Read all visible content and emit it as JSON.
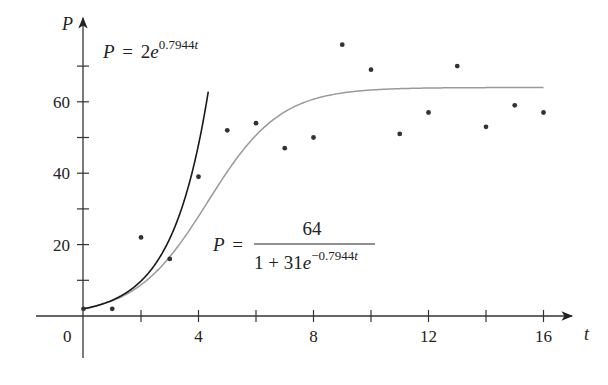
{
  "chart_data": {
    "type": "scatter",
    "title": "",
    "xlabel": "t",
    "ylabel": "P",
    "xlim": [
      -1.6,
      17.5
    ],
    "ylim": [
      -18,
      82
    ],
    "x_ticks": [
      0,
      2,
      4,
      6,
      8,
      10,
      12,
      14,
      16
    ],
    "x_tick_labels": [
      "0",
      "4",
      "8",
      "12",
      "16"
    ],
    "x_labeled_ticks": [
      0,
      4,
      8,
      12,
      16
    ],
    "y_ticks": [
      10,
      20,
      30,
      40,
      50,
      60,
      70
    ],
    "y_tick_labels": [
      "20",
      "40",
      "60"
    ],
    "y_labeled_ticks": [
      20,
      40,
      60
    ],
    "origin_label": "0",
    "grid": false,
    "legend": null,
    "series": [
      {
        "name": "data",
        "kind": "scatter",
        "color": "#333333",
        "x": [
          0,
          1,
          2,
          3,
          4,
          5,
          6,
          7,
          8,
          9,
          10,
          11,
          12,
          13,
          14,
          15,
          16
        ],
        "y": [
          2,
          2,
          22,
          16,
          39,
          52,
          54,
          47,
          50,
          76,
          69,
          51,
          57,
          70,
          53,
          59,
          57
        ]
      },
      {
        "name": "exponential",
        "kind": "line",
        "color": "#1a1a1a",
        "formula": "P = 2e^{0.7944t}",
        "a": 2,
        "k": 0.7944,
        "t_range": [
          0,
          4.35
        ]
      },
      {
        "name": "logistic",
        "kind": "line",
        "color": "#9a9a9a",
        "formula": "P = 64 / (1 + 31e^{-0.7944t})",
        "M": 64,
        "A": 31,
        "k": 0.7944,
        "t_range": [
          0,
          16
        ]
      }
    ],
    "annotations": [
      {
        "id": "exp-label",
        "lhs": "P",
        "eq": "=",
        "coef": "2",
        "base": "e",
        "exponent_num": "0.7944",
        "exponent_var": "t"
      },
      {
        "id": "log-label",
        "lhs": "P",
        "eq": "=",
        "numerator": "64",
        "denominator_prefix": "1 + 31",
        "base": "e",
        "exponent_num": "−0.7944",
        "exponent_var": "t"
      }
    ]
  }
}
